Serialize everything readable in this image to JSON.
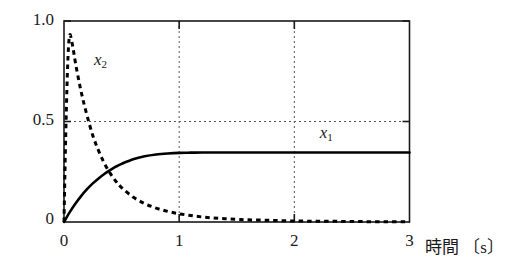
{
  "chart_data": {
    "type": "line",
    "title": "",
    "subtitle": "",
    "xlabel": "時間 〔s〕",
    "ylabel": "",
    "xlim": [
      0,
      3
    ],
    "ylim": [
      0,
      1.0
    ],
    "x_ticks": [
      "0",
      "1",
      "2",
      "3"
    ],
    "x_tick_values": [
      0,
      1,
      2,
      3
    ],
    "y_ticks": [
      "0",
      "0.5",
      "1.0"
    ],
    "y_tick_values": [
      0,
      0.5,
      1.0
    ],
    "grid": "dotted gridlines at x=1, x=2 and y=0.5",
    "legend_position": "inline annotations next to curves",
    "annotations": [
      {
        "base": "x",
        "sub": "1",
        "x": 2.22,
        "y": 0.44
      },
      {
        "base": "x",
        "sub": "2",
        "x": 0.26,
        "y": 0.8
      }
    ],
    "series": [
      {
        "name": "x1",
        "label_base": "x",
        "label_sub": "1",
        "style": "solid",
        "color": "#000000",
        "description": "rises exponentially from 0 to steady state 0.346",
        "steady_state": 0.346,
        "x": [
          0,
          0.05,
          0.1,
          0.15,
          0.2,
          0.25,
          0.3,
          0.35,
          0.4,
          0.45,
          0.5,
          0.6,
          0.7,
          0.8,
          0.9,
          1.0,
          1.1,
          1.2,
          1.3,
          1.4,
          1.5,
          1.6,
          1.8,
          2.0,
          2.2,
          2.4,
          2.6,
          2.8,
          3.0
        ],
        "y": [
          0,
          0.049,
          0.092,
          0.13,
          0.163,
          0.192,
          0.217,
          0.239,
          0.258,
          0.275,
          0.289,
          0.312,
          0.327,
          0.336,
          0.341,
          0.344,
          0.345,
          0.346,
          0.346,
          0.346,
          0.346,
          0.346,
          0.346,
          0.346,
          0.346,
          0.346,
          0.346,
          0.346,
          0.346
        ]
      },
      {
        "name": "x2",
        "label_base": "x",
        "label_sub": "2",
        "style": "dashed",
        "color": "#000000",
        "description": "spikes to 0.93 near t=0.05 then decays exponentially to 0",
        "peak_value": 0.93,
        "peak_time": 0.05,
        "x": [
          0,
          0.01,
          0.02,
          0.03,
          0.04,
          0.05,
          0.06,
          0.08,
          0.1,
          0.13,
          0.16,
          0.2,
          0.25,
          0.3,
          0.35,
          0.4,
          0.45,
          0.5,
          0.6,
          0.7,
          0.8,
          0.9,
          1.0,
          1.1,
          1.2,
          1.3,
          1.4,
          1.5,
          1.6,
          1.8,
          2.0,
          2.2,
          2.4,
          2.6,
          2.8,
          3.0
        ],
        "y": [
          0,
          0.3,
          0.55,
          0.75,
          0.88,
          0.93,
          0.92,
          0.86,
          0.79,
          0.7,
          0.62,
          0.53,
          0.43,
          0.355,
          0.292,
          0.243,
          0.203,
          0.171,
          0.124,
          0.092,
          0.069,
          0.053,
          0.041,
          0.032,
          0.025,
          0.02,
          0.016,
          0.013,
          0.011,
          0.008,
          0.005,
          0.004,
          0.003,
          0.002,
          0.001,
          0.001
        ]
      }
    ]
  },
  "colors": {
    "axis": "#1a1a1a",
    "grid": "#555555",
    "curve": "#000000",
    "background": "#ffffff"
  }
}
